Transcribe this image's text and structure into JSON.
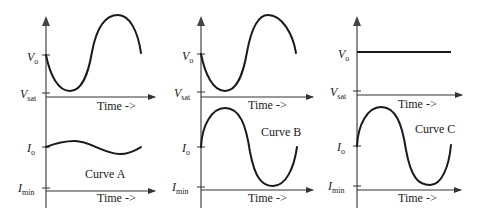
{
  "figure": {
    "panels": [
      {
        "id": "A",
        "caption": "Curve A",
        "top": {
          "y_label_main": "V",
          "y_label_main_sub": "o",
          "y_label_low": "V",
          "y_label_low_sub": "sat",
          "x_label": "Time ->",
          "description": "voltage dips from Vo to near Vsat then rises above Vo and falls back"
        },
        "bottom": {
          "y_label_main": "I",
          "y_label_main_sub": "o",
          "y_label_low": "I",
          "y_label_low_sub": "min",
          "x_label": "Time ->",
          "description": "current has small oscillation around Io"
        }
      },
      {
        "id": "B",
        "caption": "Curve B",
        "top": {
          "y_label_main": "V",
          "y_label_main_sub": "o",
          "y_label_low": "V",
          "y_label_low_sub": "sat",
          "x_label": "Time ->",
          "description": "voltage dips from Vo to near Vsat then rises above Vo and falls back"
        },
        "bottom": {
          "y_label_main": "I",
          "y_label_main_sub": "o",
          "y_label_low": "I",
          "y_label_low_sub": "min",
          "x_label": "Time ->",
          "description": "current has large oscillation between peak and near Imin"
        }
      },
      {
        "id": "C",
        "caption": "Curve C",
        "top": {
          "y_label_main": "V",
          "y_label_main_sub": "o",
          "y_label_low": "V",
          "y_label_low_sub": "sat",
          "x_label": "Time ->",
          "description": "voltage constant at Vo"
        },
        "bottom": {
          "y_label_main": "I",
          "y_label_main_sub": "o",
          "y_label_low": "I",
          "y_label_low_sub": "min",
          "x_label": "Time ->",
          "description": "current has large oscillation between peak and near Imin"
        }
      }
    ]
  }
}
